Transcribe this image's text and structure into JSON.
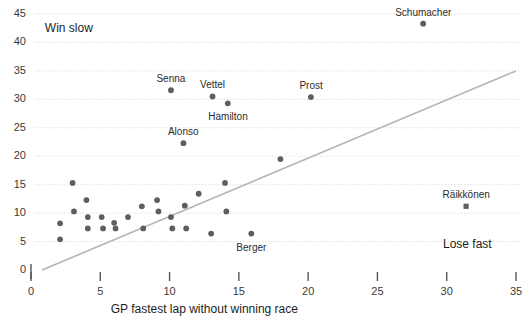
{
  "chart_data": {
    "type": "scatter",
    "title": "",
    "xlabel": "GP fastest lap without winning race",
    "ylabel": "",
    "xlim": [
      0,
      35
    ],
    "ylim": [
      0,
      45
    ],
    "grid": "horizontal-dotted",
    "legend": "none",
    "xticks": [
      "0",
      "5",
      "10",
      "15",
      "20",
      "25",
      "30",
      "35"
    ],
    "xtick_values": [
      0,
      5,
      10,
      15,
      20,
      25,
      30,
      35
    ],
    "yticks": [
      "0",
      "5",
      "10",
      "15",
      "20",
      "25",
      "30",
      "35",
      "40",
      "45"
    ],
    "ytick_values": [
      0,
      5,
      10,
      15,
      20,
      25,
      30,
      35,
      40,
      45
    ],
    "annotations": [
      {
        "text": "Win slow",
        "x": 1.0,
        "y": 42.5
      },
      {
        "text": "Lose fast",
        "x": 31.5,
        "y": 4.5
      }
    ],
    "trendline": {
      "x0": 0.8,
      "y0": 0.0,
      "x1": 35.0,
      "y1": 35.0,
      "color": "#b5b5b5"
    },
    "marker_color": "#5e5e5e",
    "labeled_points": [
      {
        "name": "Schumacher",
        "x": 28.3,
        "y": 43.3,
        "marker": "circle",
        "label_dx": 0,
        "label_dy": -11
      },
      {
        "name": "Senna",
        "x": 10.1,
        "y": 31.6,
        "marker": "circle",
        "label_dx": 0,
        "label_dy": -11
      },
      {
        "name": "Vettel",
        "x": 13.1,
        "y": 30.5,
        "marker": "circle",
        "label_dx": 0,
        "label_dy": -11
      },
      {
        "name": "Hamilton",
        "x": 14.2,
        "y": 29.3,
        "marker": "circle",
        "label_dx": 0,
        "label_dy": 14
      },
      {
        "name": "Prost",
        "x": 20.2,
        "y": 30.4,
        "marker": "circle",
        "label_dx": 0,
        "label_dy": -11
      },
      {
        "name": "Alonso",
        "x": 11.0,
        "y": 22.3,
        "marker": "circle",
        "label_dx": 0,
        "label_dy": -11
      },
      {
        "name": "Berger",
        "x": 15.9,
        "y": 6.4,
        "marker": "circle",
        "label_dx": 0,
        "label_dy": 14
      },
      {
        "name": "Räikkönen",
        "x": 31.4,
        "y": 11.2,
        "marker": "square",
        "label_dx": 0,
        "label_dy": -11
      }
    ],
    "unlabeled_points": [
      {
        "x": 2.1,
        "y": 8.2
      },
      {
        "x": 2.1,
        "y": 5.4
      },
      {
        "x": 3.0,
        "y": 15.3
      },
      {
        "x": 3.1,
        "y": 10.3
      },
      {
        "x": 4.0,
        "y": 12.3
      },
      {
        "x": 4.1,
        "y": 9.3
      },
      {
        "x": 4.1,
        "y": 7.3
      },
      {
        "x": 5.1,
        "y": 9.3
      },
      {
        "x": 5.2,
        "y": 7.3
      },
      {
        "x": 6.0,
        "y": 8.3
      },
      {
        "x": 6.1,
        "y": 7.3
      },
      {
        "x": 7.0,
        "y": 9.3
      },
      {
        "x": 8.0,
        "y": 11.2
      },
      {
        "x": 8.1,
        "y": 7.3
      },
      {
        "x": 9.1,
        "y": 12.3
      },
      {
        "x": 9.2,
        "y": 10.3
      },
      {
        "x": 10.1,
        "y": 9.3
      },
      {
        "x": 10.2,
        "y": 7.3
      },
      {
        "x": 11.1,
        "y": 11.3
      },
      {
        "x": 11.2,
        "y": 7.3
      },
      {
        "x": 12.1,
        "y": 13.4
      },
      {
        "x": 14.0,
        "y": 15.3
      },
      {
        "x": 14.1,
        "y": 10.3
      },
      {
        "x": 13.0,
        "y": 6.4
      },
      {
        "x": 18.0,
        "y": 19.5
      }
    ]
  }
}
